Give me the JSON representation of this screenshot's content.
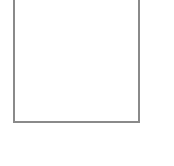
{
  "panel": {
    "border_color": "#8a8a8a",
    "background": "#ffffff",
    "content": ""
  }
}
